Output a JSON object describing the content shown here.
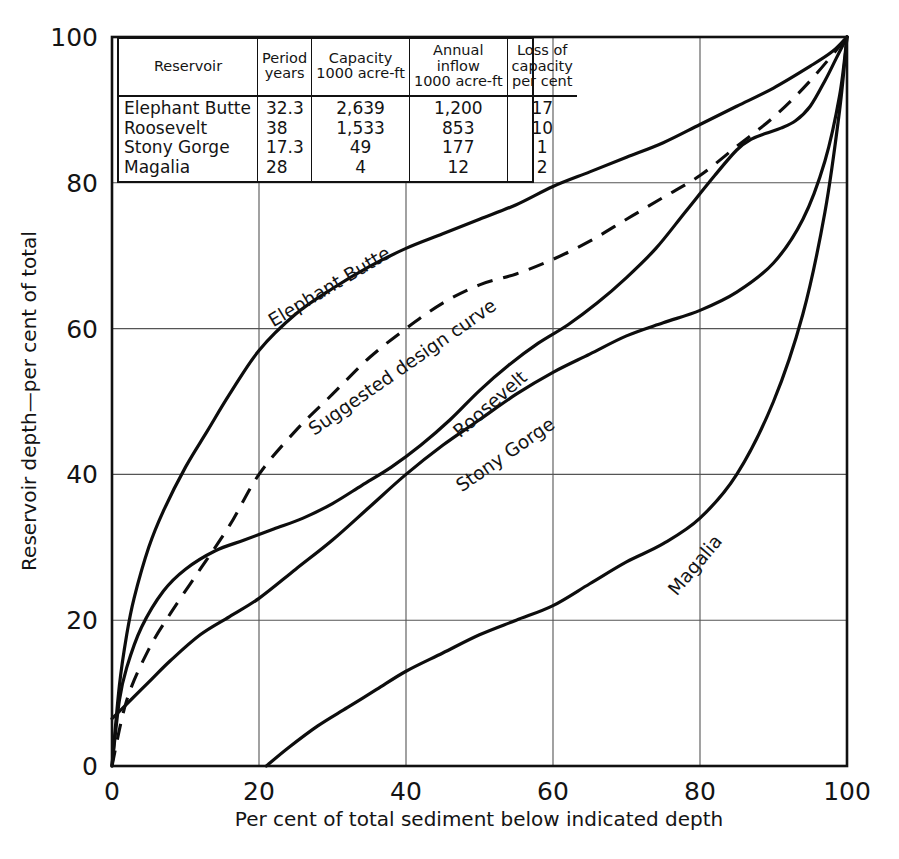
{
  "figure": {
    "background": "#ffffff",
    "ink_color": "#0d0d0d",
    "grid_color": "#555555"
  },
  "table": {
    "name": "reservoir-summary-table",
    "headers": [
      {
        "l1": "Reservoir",
        "l2": "",
        "l3": ""
      },
      {
        "l1": "Period",
        "l2": "years",
        "l3": ""
      },
      {
        "l1": "Capacity",
        "l2": "1000 acre-ft",
        "l3": ""
      },
      {
        "l1": "Annual",
        "l2": "inflow",
        "l3": "1000 acre-ft"
      },
      {
        "l1": "Loss of",
        "l2": "capacity",
        "l3": "per cent"
      }
    ],
    "rows": [
      {
        "reservoir": "Elephant Butte",
        "period": "32.3",
        "capacity": "2,639",
        "inflow": "1,200",
        "loss": "17"
      },
      {
        "reservoir": "Roosevelt",
        "period": "38",
        "capacity": "1,533",
        "inflow": "853",
        "loss": "10"
      },
      {
        "reservoir": "Stony Gorge",
        "period": "17.3",
        "capacity": "49",
        "inflow": "177",
        "loss": "1"
      },
      {
        "reservoir": "Magalia",
        "period": "28",
        "capacity": "4",
        "inflow": "12",
        "loss": "2"
      }
    ]
  },
  "chart_data": {
    "type": "line",
    "title": "",
    "xlabel": "Per cent of total sediment below indicated depth",
    "ylabel": "Reservoir depth—per cent of total",
    "xlim": [
      0,
      100
    ],
    "ylim": [
      0,
      100
    ],
    "xticks": [
      0,
      20,
      40,
      60,
      80,
      100
    ],
    "yticks": [
      0,
      20,
      40,
      60,
      80,
      100
    ],
    "xtick_labels": [
      "0",
      "20",
      "40",
      "60",
      "80",
      "100"
    ],
    "ytick_labels": [
      "0",
      "20",
      "40",
      "60",
      "80",
      "100"
    ],
    "grid": true,
    "legend": "inline-curve-labels",
    "series": [
      {
        "name": "Elephant Butte",
        "style": "solid",
        "label_anchor_x": 30,
        "label_anchor_y": 65,
        "x": [
          0,
          1,
          2,
          3,
          5,
          7,
          10,
          13,
          16,
          20,
          25,
          30,
          35,
          40,
          45,
          50,
          55,
          60,
          65,
          70,
          75,
          80,
          85,
          90,
          95,
          98,
          100
        ],
        "y": [
          0,
          11,
          18,
          23,
          30,
          35,
          41,
          46,
          51,
          57,
          62,
          65.5,
          68.5,
          71,
          73,
          75,
          77,
          79.5,
          81.5,
          83.5,
          85.5,
          88,
          90.5,
          93,
          96,
          98,
          100
        ]
      },
      {
        "name": "Suggested design curve",
        "style": "dashed",
        "label_anchor_x": 40,
        "label_anchor_y": 54,
        "x": [
          0,
          2,
          5,
          8,
          12,
          16,
          20,
          25,
          30,
          35,
          40,
          45,
          50,
          55,
          60,
          65,
          70,
          75,
          80,
          85,
          90,
          95,
          100
        ],
        "y": [
          0,
          9,
          16,
          21,
          27,
          33,
          40,
          46,
          51,
          56,
          60,
          63.5,
          66,
          67.5,
          69.5,
          72,
          75,
          78,
          81,
          85,
          89,
          94,
          100
        ]
      },
      {
        "name": "Roosevelt",
        "style": "solid",
        "label_anchor_x": 52,
        "label_anchor_y": 49,
        "x": [
          0,
          1,
          2,
          4,
          7,
          10,
          14,
          18,
          22,
          26,
          30,
          34,
          38,
          42,
          46,
          50,
          54,
          58,
          62,
          66,
          70,
          74,
          78,
          82,
          85,
          87,
          89,
          91,
          93,
          95,
          97,
          98.5,
          100
        ],
        "y": [
          0,
          9,
          13.5,
          19,
          24,
          27,
          29.5,
          31,
          32.5,
          34,
          36,
          38.5,
          41,
          44,
          47.5,
          51.5,
          55,
          58,
          60.5,
          63.5,
          67,
          71,
          76,
          81,
          84.5,
          86,
          86.8,
          87.5,
          88.5,
          90.5,
          94,
          97,
          100
        ]
      },
      {
        "name": "Stony Gorge",
        "style": "solid",
        "label_anchor_x": 54,
        "label_anchor_y": 42,
        "x": [
          0,
          2,
          5,
          8,
          12,
          16,
          20,
          25,
          30,
          35,
          40,
          45,
          50,
          55,
          60,
          65,
          70,
          75,
          80,
          85,
          90,
          94,
          97,
          99,
          100
        ],
        "y": [
          6.5,
          8.5,
          11.5,
          14.5,
          18,
          20.5,
          23,
          27,
          31,
          35.5,
          40,
          44,
          47.5,
          51,
          54,
          56.5,
          59,
          60.8,
          62.5,
          65,
          69,
          75,
          83,
          92,
          100
        ]
      },
      {
        "name": "Magalia",
        "style": "solid",
        "label_anchor_x": 80,
        "label_anchor_y": 27,
        "x": [
          21,
          24,
          28,
          32,
          36,
          40,
          45,
          50,
          55,
          60,
          65,
          70,
          75,
          80,
          85,
          90,
          94,
          97,
          99,
          100
        ],
        "y": [
          0,
          2.5,
          5.5,
          8,
          10.5,
          13,
          15.5,
          18,
          20,
          22,
          25,
          28,
          30.5,
          34,
          40,
          50,
          62,
          76,
          90,
          100
        ]
      }
    ]
  }
}
